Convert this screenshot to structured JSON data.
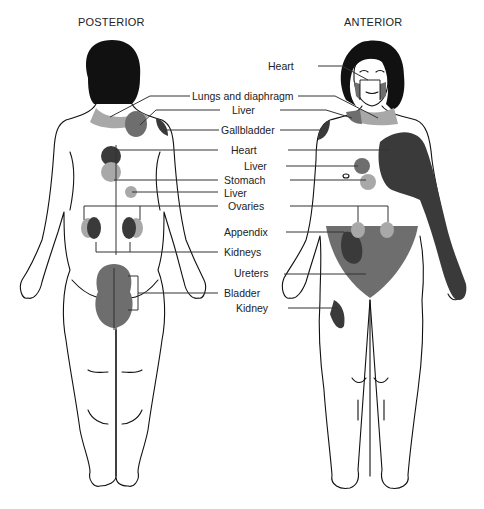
{
  "views": {
    "posterior": {
      "title": "POSTERIOR"
    },
    "anterior": {
      "title": "ANTERIOR"
    }
  },
  "labels": [
    {
      "id": "heart_face",
      "text": "Heart"
    },
    {
      "id": "lungs_diaphragm",
      "text": "Lungs and diaphragm"
    },
    {
      "id": "liver_shoulder",
      "text": "Liver"
    },
    {
      "id": "gallbladder",
      "text": "Gallbladder"
    },
    {
      "id": "heart_chest",
      "text": "Heart"
    },
    {
      "id": "liver_abdomen",
      "text": "Liver"
    },
    {
      "id": "stomach",
      "text": "Stomach"
    },
    {
      "id": "liver_back",
      "text": "Liver"
    },
    {
      "id": "ovaries",
      "text": "Ovaries"
    },
    {
      "id": "appendix",
      "text": "Appendix"
    },
    {
      "id": "kidneys",
      "text": "Kidneys"
    },
    {
      "id": "ureters",
      "text": "Ureters"
    },
    {
      "id": "bladder",
      "text": "Bladder"
    },
    {
      "id": "kidney",
      "text": "Kidney"
    }
  ],
  "colors": {
    "outline": "#111111",
    "hair": "#111111",
    "dark_region": "#3a3a3a",
    "medium_region": "#6e6e6e",
    "light_region": "#a8a8a8",
    "leader_line": "#333333",
    "background": "#ffffff"
  }
}
